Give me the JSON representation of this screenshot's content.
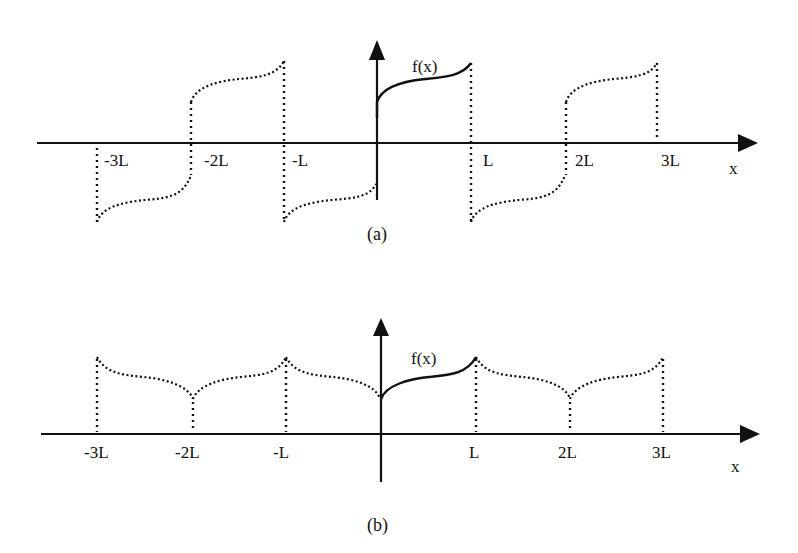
{
  "figure": {
    "panels": [
      {
        "id": "a",
        "caption": "(a)",
        "function_label": "f(x)",
        "x_axis_label": "x",
        "extension": "odd periodic extension",
        "tick_labels": [
          "-3L",
          "-2L",
          "-L",
          "L",
          "2L",
          "3L"
        ]
      },
      {
        "id": "b",
        "caption": "(b)",
        "function_label": "f(x)",
        "x_axis_label": "x",
        "extension": "even periodic extension",
        "tick_labels": [
          "-3L",
          "-2L",
          "-L",
          "L",
          "2L",
          "3L"
        ]
      }
    ]
  },
  "colors": {
    "ink": "#111111",
    "background": "#ffffff"
  }
}
